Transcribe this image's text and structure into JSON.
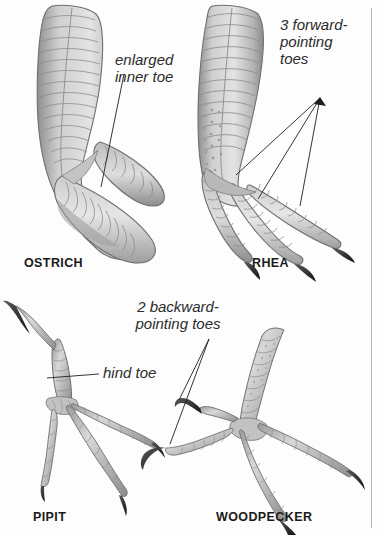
{
  "figure": {
    "kind": "bird-foot-anatomy-diagram",
    "background_color": "#fdfdfd",
    "rule_color": "#b9b9b9",
    "ink_color": "#2b2b2b",
    "art_fill_light": "#d9d9d9",
    "art_fill_mid": "#b0b0b0",
    "art_fill_dark": "#6e6e6e",
    "claw_color": "#3a3a3a"
  },
  "panels": [
    {
      "id": "ostrich",
      "caption": "OSTRICH",
      "annotation": "enlarged\ninner toe",
      "toe_count_note": "2 toes, enlarged inner toe"
    },
    {
      "id": "rhea",
      "caption": "RHEA",
      "annotation": "3 forward-\npointing\ntoes",
      "toe_count_note": "3 forward-pointing toes"
    },
    {
      "id": "pipit",
      "caption": "PIPIT",
      "annotation": "hind toe",
      "toe_count_note": "3 forward toes + 1 hind toe"
    },
    {
      "id": "woodpecker",
      "caption": "WOODPECKER",
      "annotation": "2 backward-\npointing toes",
      "toe_count_note": "2 forward + 2 backward toes (zygodactyl)"
    }
  ]
}
